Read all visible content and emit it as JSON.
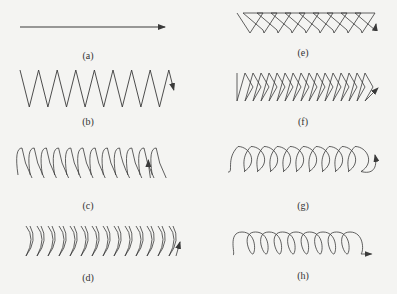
{
  "figure": {
    "stroke_color": "#3a3a3a",
    "background": "#f4f4f2"
  },
  "panels": [
    {
      "id": "a",
      "label": "(a)",
      "pattern": "straight-line",
      "label_x": 88,
      "label_y": 50
    },
    {
      "id": "b",
      "label": "(b)",
      "pattern": "zigzag",
      "label_x": 88,
      "label_y": 116
    },
    {
      "id": "c",
      "label": "(c)",
      "pattern": "crescent-forward",
      "label_x": 88,
      "label_y": 200
    },
    {
      "id": "d",
      "label": "(d)",
      "pattern": "crescent-backward",
      "label_x": 88,
      "label_y": 272
    },
    {
      "id": "e",
      "label": "(e)",
      "pattern": "triangle-oblique",
      "label_x": 303,
      "label_y": 47
    },
    {
      "id": "f",
      "label": "(f)",
      "pattern": "triangle",
      "label_x": 303,
      "label_y": 116
    },
    {
      "id": "g",
      "label": "(g)",
      "pattern": "circle",
      "label_x": 303,
      "label_y": 200
    },
    {
      "id": "h",
      "label": "(h)",
      "pattern": "oblique-circle",
      "label_x": 303,
      "label_y": 270
    }
  ]
}
